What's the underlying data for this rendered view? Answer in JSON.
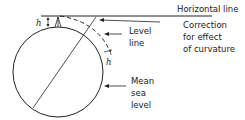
{
  "diagram": {
    "labels": {
      "horizontal_line": "Horizontal line",
      "correction_1": "Correction",
      "correction_2": "for effect",
      "correction_3": "of curvature",
      "level_line_1": "Level",
      "level_line_2": "line",
      "mean_sea_1": "Mean",
      "mean_sea_2": "sea",
      "mean_sea_3": "level",
      "h_top": "h",
      "h_right": "h"
    },
    "colors": {
      "stroke": "#222222",
      "background": "#ffffff"
    }
  }
}
